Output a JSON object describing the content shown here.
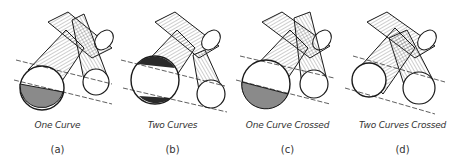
{
  "figure": {
    "panels": [
      {
        "id": "a",
        "caption": "One Curve",
        "label": "(a)"
      },
      {
        "id": "b",
        "caption": "Two Curves",
        "label": "(b)"
      },
      {
        "id": "c",
        "caption": "One Curve Crossed",
        "label": "(c)"
      },
      {
        "id": "d",
        "caption": "Two Curves Crossed",
        "label": "(d)"
      }
    ],
    "colors": {
      "line": "#1a1a1a",
      "shade": "#8a8a8a",
      "dark_shade": "#2a2a2a",
      "hatch": "#555555"
    }
  }
}
